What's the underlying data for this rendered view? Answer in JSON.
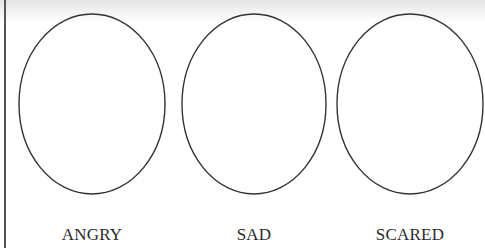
{
  "worksheet": {
    "faces": [
      {
        "label": "ANGRY",
        "cx": 92,
        "cy": 104,
        "rx": 73,
        "ry": 90
      },
      {
        "label": "SAD",
        "cx": 254,
        "cy": 104,
        "rx": 72,
        "ry": 90
      },
      {
        "label": "SCARED",
        "cx": 410,
        "cy": 104,
        "rx": 73,
        "ry": 90
      }
    ],
    "colors": {
      "outline": "#333333",
      "text": "#2a2a2a",
      "background": "#ffffff"
    }
  }
}
